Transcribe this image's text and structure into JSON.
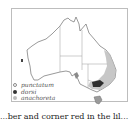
{
  "map": {
    "region": "Australia",
    "colors": {
      "outline": "#6e6e6e",
      "borders": "#9a9a9a",
      "anachoreta_fill": "#b8b8b8",
      "dorsi_fill": "#2e2e2e",
      "punctatum_marker": "#888888"
    }
  },
  "legend": {
    "items": [
      {
        "label": "punctatum",
        "color": "#8a8a8a",
        "style": "ring"
      },
      {
        "label": "dorsi",
        "color": "#333333",
        "style": "solid"
      },
      {
        "label": "anachoreta",
        "color": "#bdbdbd",
        "style": "solid"
      }
    ]
  },
  "caption": {
    "text": "...ber and corner red in the lil..."
  }
}
